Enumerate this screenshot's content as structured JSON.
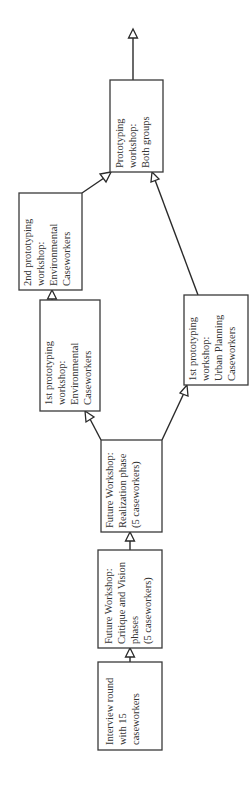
{
  "diagram": {
    "orientation": "rotated-90-ccw",
    "nodes": [
      {
        "id": "interview",
        "lines": [
          "Interview round",
          "with 15",
          "caseworkers"
        ]
      },
      {
        "id": "fw_critique",
        "lines": [
          "Future Workshop:",
          "Critique and Vision",
          "phases",
          "(5 caseworkers)"
        ]
      },
      {
        "id": "fw_realization",
        "lines": [
          "Future Workshop:",
          "Realization phase",
          "(5 caseworkers)"
        ]
      },
      {
        "id": "proto1_env",
        "lines": [
          "1st prototyping",
          "workshop:",
          "Environmental",
          "Caseworkers"
        ]
      },
      {
        "id": "proto2_env",
        "lines": [
          "2nd prototyping",
          "workshop:",
          "Environmental",
          "Caseworkers"
        ]
      },
      {
        "id": "proto_both",
        "lines": [
          "Prototyping",
          "workshop:",
          "Both groups"
        ]
      },
      {
        "id": "proto1_urban",
        "lines": [
          "1st prototyping",
          "workshop:",
          "Urban Planning",
          "Caseworkers"
        ]
      }
    ],
    "edges": [
      {
        "from": "interview",
        "to": "fw_critique"
      },
      {
        "from": "fw_critique",
        "to": "fw_realization"
      },
      {
        "from": "fw_realization",
        "to": "proto1_env"
      },
      {
        "from": "fw_realization",
        "to": "proto1_urban"
      },
      {
        "from": "proto1_env",
        "to": "proto2_env"
      },
      {
        "from": "proto2_env",
        "to": "proto_both"
      },
      {
        "from": "proto1_urban",
        "to": "proto_both"
      },
      {
        "from": "proto_both",
        "to": "continuation"
      }
    ]
  }
}
